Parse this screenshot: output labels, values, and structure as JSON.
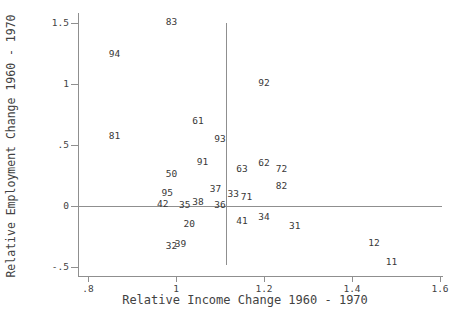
{
  "chart_data": {
    "type": "scatter",
    "title": "",
    "xlabel": "Relative Income Change 1960 - 1970",
    "ylabel": "Relative Employment Change 1960 - 1970",
    "xlim": [
      0.8,
      1.6
    ],
    "ylim": [
      -0.5,
      1.5
    ],
    "grid": false,
    "legend": "none",
    "marker_style": "numeric-code-labels",
    "x_ticks": [
      0.8,
      1.0,
      1.2,
      1.4,
      1.6
    ],
    "x_tick_labels": [
      ".8",
      "1",
      "1.2",
      "1.4",
      "1.6"
    ],
    "y_ticks": [
      1.5,
      1.0,
      0.5,
      0.0,
      -0.5
    ],
    "y_tick_labels": [
      "1.5",
      "1",
      ".5",
      "0",
      "-.5"
    ],
    "reference_lines": {
      "h_line_y": 0,
      "v_line_x": 1.113
    },
    "points": [
      {
        "label": "83",
        "x": 0.99,
        "y": 1.51
      },
      {
        "label": "94",
        "x": 0.86,
        "y": 1.25
      },
      {
        "label": "92",
        "x": 1.2,
        "y": 1.01
      },
      {
        "label": "61",
        "x": 1.05,
        "y": 0.7
      },
      {
        "label": "81",
        "x": 0.86,
        "y": 0.57
      },
      {
        "label": "93",
        "x": 1.1,
        "y": 0.55
      },
      {
        "label": "91",
        "x": 1.06,
        "y": 0.36
      },
      {
        "label": "62",
        "x": 1.2,
        "y": 0.35
      },
      {
        "label": "63",
        "x": 1.15,
        "y": 0.3
      },
      {
        "label": "72",
        "x": 1.24,
        "y": 0.3
      },
      {
        "label": "50",
        "x": 0.99,
        "y": 0.26
      },
      {
        "label": "82",
        "x": 1.24,
        "y": 0.16
      },
      {
        "label": "37",
        "x": 1.09,
        "y": 0.14
      },
      {
        "label": "95",
        "x": 0.98,
        "y": 0.11
      },
      {
        "label": "33",
        "x": 1.13,
        "y": 0.1
      },
      {
        "label": "71",
        "x": 1.16,
        "y": 0.07
      },
      {
        "label": "42",
        "x": 0.97,
        "y": 0.02
      },
      {
        "label": "38",
        "x": 1.05,
        "y": 0.03
      },
      {
        "label": "35",
        "x": 1.02,
        "y": 0.01
      },
      {
        "label": "36",
        "x": 1.1,
        "y": 0.01
      },
      {
        "label": "34",
        "x": 1.2,
        "y": -0.09
      },
      {
        "label": "41",
        "x": 1.15,
        "y": -0.12
      },
      {
        "label": "20",
        "x": 1.03,
        "y": -0.15
      },
      {
        "label": "31",
        "x": 1.27,
        "y": -0.16
      },
      {
        "label": "39",
        "x": 1.01,
        "y": -0.31
      },
      {
        "label": "32",
        "x": 0.99,
        "y": -0.33
      },
      {
        "label": "12",
        "x": 1.45,
        "y": -0.3
      },
      {
        "label": "11",
        "x": 1.49,
        "y": -0.46
      }
    ]
  }
}
